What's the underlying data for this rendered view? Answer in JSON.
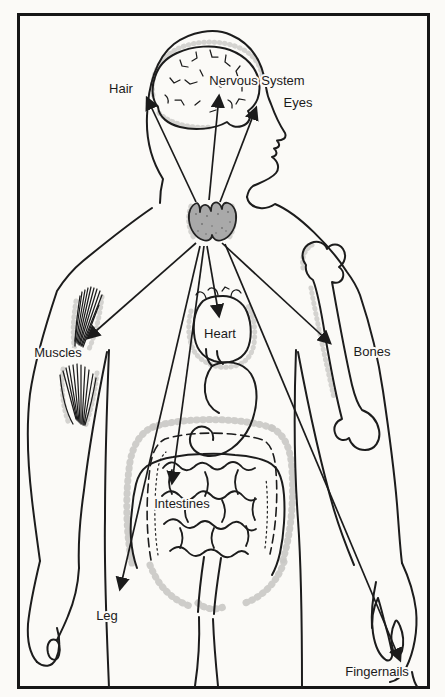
{
  "diagram": {
    "labels": {
      "hair": "Hair",
      "nervous_system": "Nervous System",
      "eyes": "Eyes",
      "muscles": "Muscles",
      "heart": "Heart",
      "bones": "Bones",
      "intestines": "Intestines",
      "leg": "Leg",
      "fingernails": "Fingernails"
    },
    "organs_depicted": [
      "brain",
      "thyroid gland",
      "heart",
      "stomach",
      "intestines",
      "humerus bone",
      "arm muscles"
    ],
    "arrow_count": 9,
    "colors": {
      "line": "#1c1c1c",
      "shading_stipple": "#c9c8c4",
      "thyroid_fill": "#a9a9a9",
      "background": "#fbfaf7"
    }
  }
}
